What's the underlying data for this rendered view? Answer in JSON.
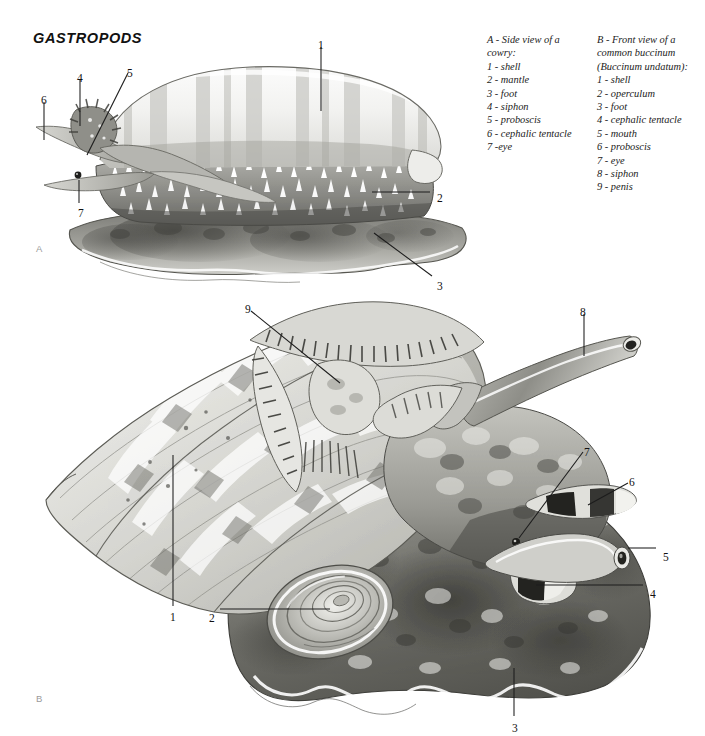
{
  "page": {
    "title": "GASTROPODS",
    "background": "#ffffff",
    "ink": "#1c1c1c"
  },
  "panels": [
    {
      "id": "A",
      "letter": "A"
    },
    {
      "id": "B",
      "letter": "B"
    }
  ],
  "legends": [
    {
      "id": "legend-a",
      "heading": [
        "A - Side view of a",
        "cowry:"
      ],
      "items": [
        "1 - shell",
        "2 - mantle",
        "3 - foot",
        "4 - siphon",
        "5 - proboscis",
        "6 - cephalic tentacle",
        "7 -eye"
      ]
    },
    {
      "id": "legend-b",
      "heading": [
        "B - Front view of a",
        "common buccinum",
        "(Buccinum undatum):"
      ],
      "items": [
        "1 - shell",
        "2 - operculum",
        "3 - foot",
        "4 - cephalic tentacle",
        "5 - mouth",
        "6 - proboscis",
        "7 - eye",
        "8 - siphon",
        "9 - penis"
      ]
    }
  ],
  "callouts_a": [
    {
      "label": "1",
      "x": 318,
      "y": 40,
      "name": "callout-a-1-shell"
    },
    {
      "label": "2",
      "x": 437,
      "y": 193,
      "name": "callout-a-2-mantle"
    },
    {
      "label": "3",
      "x": 437,
      "y": 281,
      "name": "callout-a-3-foot"
    },
    {
      "label": "4",
      "x": 77,
      "y": 73,
      "name": "callout-a-4-siphon"
    },
    {
      "label": "5",
      "x": 127,
      "y": 68,
      "name": "callout-a-5-proboscis"
    },
    {
      "label": "6",
      "x": 41,
      "y": 95,
      "name": "callout-a-6-cephalic-tentacle"
    },
    {
      "label": "7",
      "x": 78,
      "y": 208,
      "name": "callout-a-7-eye"
    }
  ],
  "callouts_b": [
    {
      "label": "1",
      "x": 170,
      "y": 612,
      "name": "callout-b-1-shell"
    },
    {
      "label": "2",
      "x": 209,
      "y": 613,
      "name": "callout-b-2-operculum"
    },
    {
      "label": "3",
      "x": 512,
      "y": 723,
      "name": "callout-b-3-foot"
    },
    {
      "label": "4",
      "x": 650,
      "y": 589,
      "name": "callout-b-4-cephalic-tentacle"
    },
    {
      "label": "5",
      "x": 663,
      "y": 552,
      "name": "callout-b-5-mouth"
    },
    {
      "label": "6",
      "x": 629,
      "y": 477,
      "name": "callout-b-6-proboscis"
    },
    {
      "label": "7",
      "x": 584,
      "y": 447,
      "name": "callout-b-7-eye"
    },
    {
      "label": "8",
      "x": 580,
      "y": 307,
      "name": "callout-b-8-siphon"
    },
    {
      "label": "9",
      "x": 245,
      "y": 304,
      "name": "callout-b-9-penis"
    }
  ],
  "figure_a": {
    "caption_letter": "A",
    "subject": "cowry",
    "parts": [
      "shell",
      "mantle",
      "foot",
      "siphon",
      "proboscis",
      "cephalic tentacle",
      "eye"
    ]
  },
  "figure_b": {
    "caption_letter": "B",
    "subject": "Buccinum undatum",
    "parts": [
      "shell",
      "operculum",
      "foot",
      "cephalic tentacle",
      "mouth",
      "proboscis",
      "eye",
      "siphon",
      "penis"
    ]
  }
}
